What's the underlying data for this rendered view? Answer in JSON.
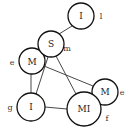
{
  "diagram": {
    "nodes": [
      {
        "id": "n1",
        "label": "I",
        "side_label": "l",
        "cx": 81,
        "cy": 16,
        "r": 13,
        "lx": 101,
        "ly": 16
      },
      {
        "id": "n2",
        "label": "S",
        "side_label": "m",
        "cx": 51,
        "cy": 44,
        "r": 13,
        "lx": 67,
        "ly": 48
      },
      {
        "id": "n3",
        "label": "M",
        "side_label": "e",
        "cx": 32,
        "cy": 61,
        "r": 13,
        "lx": 12,
        "ly": 62
      },
      {
        "id": "n4",
        "label": "I",
        "side_label": "g",
        "cx": 31,
        "cy": 107,
        "r": 14,
        "lx": 10,
        "ly": 107
      },
      {
        "id": "n5",
        "label": "M",
        "side_label": "e",
        "cx": 105,
        "cy": 92,
        "r": 13,
        "lx": 122,
        "ly": 92
      },
      {
        "id": "n6",
        "label": "MI",
        "side_label": "f",
        "cx": 84,
        "cy": 109,
        "r": 17,
        "lx": 107,
        "ly": 118
      }
    ],
    "edges": [
      {
        "from": "n1",
        "to": "n2"
      },
      {
        "from": "n3",
        "to": "n4"
      },
      {
        "from": "n2",
        "to": "n4"
      },
      {
        "from": "n2",
        "to": "n6"
      },
      {
        "from": "n3",
        "to": "n5"
      },
      {
        "from": "n4",
        "to": "n6"
      }
    ]
  }
}
